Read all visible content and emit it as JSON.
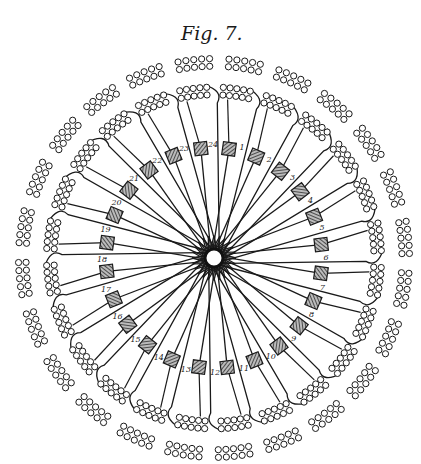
{
  "figure": {
    "title": "Fig. 7.",
    "center": [
      214,
      258
    ],
    "hub_radius": 9,
    "coil_count": 24,
    "coil_labels": [
      "1",
      "2",
      "3",
      "4",
      "5",
      "6",
      "7",
      "8",
      "9",
      "10",
      "11",
      "12",
      "13",
      "14",
      "15",
      "16",
      "17",
      "18",
      "19",
      "20",
      "21",
      "22",
      "23",
      "24"
    ],
    "coil_radius": 108,
    "start_angle_deg": -82,
    "cluster_radius_inner": 160,
    "cluster_radius_outer": 188,
    "ink_color": "#1a1a1a",
    "coil_fill": "#6a6a6a",
    "background": "#ffffff"
  }
}
